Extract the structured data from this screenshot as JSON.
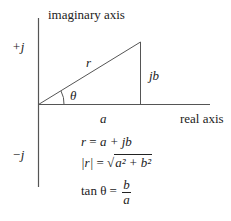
{
  "diagram": {
    "type": "argand-diagram",
    "axes": {
      "vertical_label": "imaginary axis",
      "horizontal_label": "real axis",
      "positive_imag_label": "+j",
      "negative_imag_label": "−j"
    },
    "triangle": {
      "hypotenuse_label": "r",
      "opposite_label": "jb",
      "adjacent_label": "a",
      "angle_label": "θ"
    },
    "equations": {
      "eq1": {
        "lhs": "r",
        "rhs": "a + jb"
      },
      "eq2": {
        "lhs": "|r|",
        "rhs_radicand": "a² + b²"
      },
      "eq3": {
        "lhs": "tan θ",
        "numerator": "b",
        "denominator": "a"
      }
    },
    "colors": {
      "line": "#333333",
      "text": "#222222",
      "background": "#ffffff"
    }
  }
}
